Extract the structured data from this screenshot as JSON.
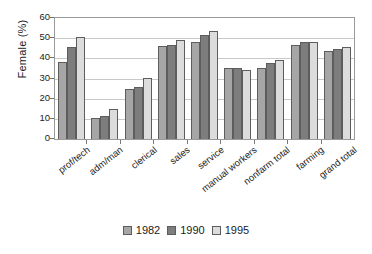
{
  "chart_data": {
    "type": "bar",
    "title": "",
    "xlabel": "",
    "ylabel": "Female (%)",
    "ylim": [
      0,
      60
    ],
    "ytick_step": 10,
    "yticks": [
      60,
      50,
      40,
      30,
      20,
      10,
      0
    ],
    "grid": true,
    "legend_position": "bottom",
    "categories": [
      "prof/tech",
      "adm/man",
      "clerical",
      "sales",
      "service",
      "manual workers",
      "nonfarm total",
      "farming",
      "grand total"
    ],
    "series": [
      {
        "name": "1982",
        "color": "#a6a6a6",
        "values": [
          38.0,
          10.3,
          24.8,
          46.0,
          48.0,
          35.2,
          35.2,
          46.6,
          43.5
        ]
      },
      {
        "name": "1990",
        "color": "#7d7d7d",
        "values": [
          45.6,
          11.3,
          25.8,
          46.5,
          51.6,
          35.3,
          37.5,
          48.0,
          44.4
        ]
      },
      {
        "name": "1995",
        "color": "#dcdcdc",
        "values": [
          50.6,
          14.7,
          30.4,
          49.0,
          53.7,
          34.4,
          39.1,
          48.3,
          45.6
        ]
      }
    ]
  },
  "axis": {
    "y_title": "Female (%)"
  },
  "legend": {
    "entries": [
      {
        "label": "1982",
        "color": "#a6a6a6"
      },
      {
        "label": "1990",
        "color": "#7d7d7d"
      },
      {
        "label": "1995",
        "color": "#dcdcdc"
      }
    ]
  }
}
